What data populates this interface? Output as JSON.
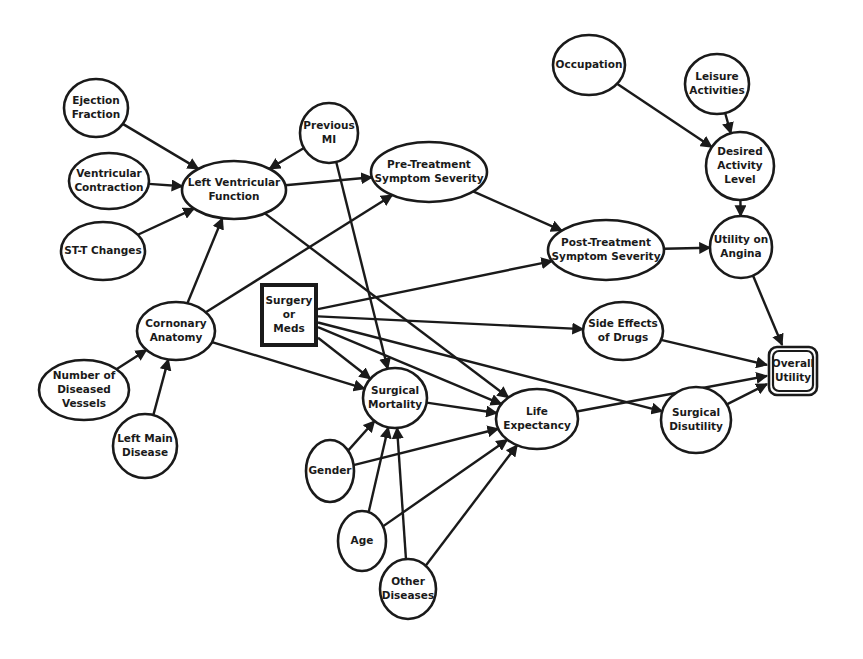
{
  "diagram": {
    "type": "influence-diagram",
    "colors": {
      "stroke": "#1a1a1a",
      "background": "#ffffff"
    },
    "nodes": [
      {
        "id": "ejection_fraction",
        "lines": [
          "Ejection",
          "Fraction"
        ],
        "shape": "ellipse",
        "cx": 96,
        "cy": 108,
        "rx": 32,
        "ry": 29
      },
      {
        "id": "ventricular_contraction",
        "lines": [
          "Ventricular",
          "Contraction"
        ],
        "shape": "ellipse",
        "cx": 109,
        "cy": 181,
        "rx": 40,
        "ry": 28
      },
      {
        "id": "st_t_changes",
        "lines": [
          "ST-T Changes"
        ],
        "shape": "ellipse",
        "cx": 103,
        "cy": 251,
        "rx": 42,
        "ry": 29
      },
      {
        "id": "left_ventricular_function",
        "lines": [
          "Left Ventricular",
          "Function"
        ],
        "shape": "ellipse",
        "cx": 234,
        "cy": 190,
        "rx": 52,
        "ry": 29
      },
      {
        "id": "previous_mi",
        "lines": [
          "Previous",
          "MI"
        ],
        "shape": "ellipse",
        "cx": 329,
        "cy": 133,
        "rx": 29,
        "ry": 30
      },
      {
        "id": "pre_treatment_symptom_severity",
        "lines": [
          "Pre-Treatment",
          "Symptom Severity"
        ],
        "shape": "ellipse",
        "cx": 429,
        "cy": 172,
        "rx": 58,
        "ry": 30
      },
      {
        "id": "occupation",
        "lines": [
          "Occupation"
        ],
        "shape": "ellipse",
        "cx": 589,
        "cy": 65,
        "rx": 36,
        "ry": 30
      },
      {
        "id": "leisure_activities",
        "lines": [
          "Leisure",
          "Activities"
        ],
        "shape": "ellipse",
        "cx": 717,
        "cy": 84,
        "rx": 32,
        "ry": 30
      },
      {
        "id": "desired_activity_level",
        "lines": [
          "Desired",
          "Activity",
          "Level"
        ],
        "shape": "ellipse",
        "cx": 740,
        "cy": 166,
        "rx": 34,
        "ry": 34
      },
      {
        "id": "post_treatment_symptom_severity",
        "lines": [
          "Post-Treatment",
          "Symptom Severity"
        ],
        "shape": "ellipse",
        "cx": 606,
        "cy": 250,
        "rx": 58,
        "ry": 30
      },
      {
        "id": "utility_on_angina",
        "lines": [
          "Utility on",
          "Angina"
        ],
        "shape": "ellipse",
        "cx": 741,
        "cy": 247,
        "rx": 31,
        "ry": 31
      },
      {
        "id": "surgery_or_meds",
        "lines": [
          "Surgery",
          "or",
          "Meds"
        ],
        "shape": "decision",
        "x": 262,
        "y": 285,
        "w": 54,
        "h": 60
      },
      {
        "id": "cornonary_anatomy",
        "lines": [
          "Cornonary",
          "Anatomy"
        ],
        "shape": "ellipse",
        "cx": 176,
        "cy": 331,
        "rx": 39,
        "ry": 29
      },
      {
        "id": "side_effects_of_drugs",
        "lines": [
          "Side Effects",
          "of Drugs"
        ],
        "shape": "ellipse",
        "cx": 623,
        "cy": 331,
        "rx": 40,
        "ry": 29
      },
      {
        "id": "overall_utility",
        "lines": [
          "Overall",
          "Utility"
        ],
        "shape": "value",
        "x": 769,
        "y": 347,
        "w": 48,
        "h": 48
      },
      {
        "id": "number_of_diseased_vessels",
        "lines": [
          "Number of",
          "Diseased",
          "Vessels"
        ],
        "shape": "ellipse",
        "cx": 84,
        "cy": 390,
        "rx": 45,
        "ry": 30
      },
      {
        "id": "left_main_disease",
        "lines": [
          "Left Main",
          "Disease"
        ],
        "shape": "ellipse",
        "cx": 145,
        "cy": 446,
        "rx": 32,
        "ry": 32
      },
      {
        "id": "surgical_mortality",
        "lines": [
          "Surgical",
          "Mortality"
        ],
        "shape": "ellipse",
        "cx": 395,
        "cy": 398,
        "rx": 32,
        "ry": 30
      },
      {
        "id": "life_expectancy",
        "lines": [
          "Life",
          "Expectancy"
        ],
        "shape": "ellipse",
        "cx": 537,
        "cy": 419,
        "rx": 41,
        "ry": 30
      },
      {
        "id": "surgical_disutility",
        "lines": [
          "Surgical",
          "Disutility"
        ],
        "shape": "ellipse",
        "cx": 696,
        "cy": 420,
        "rx": 35,
        "ry": 33
      },
      {
        "id": "gender",
        "lines": [
          "Gender"
        ],
        "shape": "ellipse",
        "cx": 330,
        "cy": 471,
        "rx": 24,
        "ry": 31
      },
      {
        "id": "age",
        "lines": [
          "Age"
        ],
        "shape": "ellipse",
        "cx": 362,
        "cy": 541,
        "rx": 24,
        "ry": 30
      },
      {
        "id": "other_diseases",
        "lines": [
          "Other",
          "Diseases"
        ],
        "shape": "ellipse",
        "cx": 408,
        "cy": 589,
        "rx": 28,
        "ry": 30
      }
    ],
    "edges": [
      [
        "ejection_fraction",
        "left_ventricular_function"
      ],
      [
        "ventricular_contraction",
        "left_ventricular_function"
      ],
      [
        "st_t_changes",
        "left_ventricular_function"
      ],
      [
        "previous_mi",
        "left_ventricular_function"
      ],
      [
        "cornonary_anatomy",
        "left_ventricular_function"
      ],
      [
        "left_ventricular_function",
        "pre_treatment_symptom_severity"
      ],
      [
        "cornonary_anatomy",
        "pre_treatment_symptom_severity"
      ],
      [
        "left_ventricular_function",
        "life_expectancy"
      ],
      [
        "previous_mi",
        "surgical_mortality"
      ],
      [
        "pre_treatment_symptom_severity",
        "post_treatment_symptom_severity"
      ],
      [
        "surgery_or_meds",
        "post_treatment_symptom_severity"
      ],
      [
        "occupation",
        "desired_activity_level"
      ],
      [
        "leisure_activities",
        "desired_activity_level"
      ],
      [
        "desired_activity_level",
        "utility_on_angina"
      ],
      [
        "post_treatment_symptom_severity",
        "utility_on_angina"
      ],
      [
        "utility_on_angina",
        "overall_utility"
      ],
      [
        "surgery_or_meds",
        "side_effects_of_drugs"
      ],
      [
        "side_effects_of_drugs",
        "overall_utility"
      ],
      [
        "surgery_or_meds",
        "surgical_disutility"
      ],
      [
        "surgical_disutility",
        "overall_utility"
      ],
      [
        "life_expectancy",
        "overall_utility"
      ],
      [
        "surgery_or_meds",
        "surgical_mortality"
      ],
      [
        "surgery_or_meds",
        "life_expectancy"
      ],
      [
        "cornonary_anatomy",
        "surgical_mortality"
      ],
      [
        "number_of_diseased_vessels",
        "cornonary_anatomy"
      ],
      [
        "left_main_disease",
        "cornonary_anatomy"
      ],
      [
        "surgical_mortality",
        "life_expectancy"
      ],
      [
        "gender",
        "surgical_mortality"
      ],
      [
        "gender",
        "life_expectancy"
      ],
      [
        "age",
        "surgical_mortality"
      ],
      [
        "age",
        "life_expectancy"
      ],
      [
        "other_diseases",
        "surgical_mortality"
      ],
      [
        "other_diseases",
        "life_expectancy"
      ]
    ]
  }
}
